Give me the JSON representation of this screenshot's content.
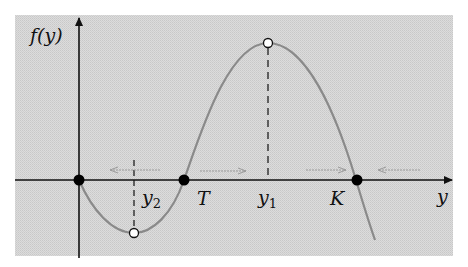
{
  "diagram": {
    "type": "phase-line / population growth function plot",
    "y_axis_label": "f(y)",
    "x_axis_label": "y",
    "points": {
      "origin": {
        "label": "",
        "kind": "equilibrium-filled"
      },
      "T": {
        "label": "T",
        "kind": "equilibrium-filled"
      },
      "K": {
        "label": "K",
        "kind": "equilibrium-filled"
      },
      "y2": {
        "label": "y",
        "subscript": "2",
        "kind": "local-minimum-open"
      },
      "y1": {
        "label": "y",
        "subscript": "1",
        "kind": "local-maximum-open"
      }
    },
    "flow_arrows": [
      {
        "from": "y2 region",
        "direction": "left"
      },
      {
        "from": "T to y1",
        "direction": "right"
      },
      {
        "from": "y1 to K",
        "direction": "right"
      },
      {
        "from": "beyond K",
        "direction": "left"
      }
    ],
    "colors": {
      "background_panel": "#d9d9d9",
      "axis": "#111111",
      "curve": "#8a8a8a",
      "arrows": "#9a9a9a",
      "dots": "#000000"
    }
  }
}
